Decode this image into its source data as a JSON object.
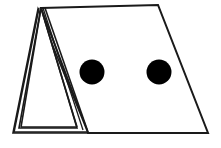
{
  "figure": {
    "background_color": "#ffffff",
    "stroke_color": "#1a1a1a",
    "dot_color": "#000000",
    "canvas": {
      "width": 221,
      "height": 148
    },
    "stroke_widths": {
      "panel_outline": 2.0,
      "fold_line": 1.6,
      "thin_fold_line": 1.3
    },
    "shapes": {
      "main_panel": {
        "name": "large-right-panel",
        "points": "41,8 158,5 208,133 88,133",
        "fill": "#ffffff"
      },
      "tent_triangle": {
        "name": "left-tent-triangle",
        "points": "41,8 77,128 19,128",
        "fill": "#ffffff"
      },
      "tent_outer_triangle": {
        "name": "left-tent-outer-triangle",
        "points": "38,9 88,133 13,133",
        "fill": "#ffffff"
      },
      "fold_lines": [
        {
          "name": "fold-left-inner",
          "d": "M 41,8 L 21,127"
        },
        {
          "name": "fold-left-outer",
          "d": "M 39,8 L 14,132"
        },
        {
          "name": "fold-base-inner",
          "d": "M 21,127 L 77,127"
        },
        {
          "name": "fold-base-outer",
          "d": "M 14,132 L 88,132"
        },
        {
          "name": "fold-right-a",
          "d": "M 41,8 L 77,127"
        },
        {
          "name": "fold-right-b",
          "d": "M 43,8 L 83,130"
        },
        {
          "name": "fold-right-c",
          "d": "M 45,8 L 88,132"
        },
        {
          "name": "spine-ridge",
          "d": "M 41,8 L 44,8"
        }
      ]
    },
    "dots": [
      {
        "name": "dot-left",
        "cx": 92,
        "cy": 72,
        "r": 12.5,
        "color": "#000000"
      },
      {
        "name": "dot-right",
        "cx": 159,
        "cy": 72,
        "r": 12.5,
        "color": "#000000"
      }
    ]
  }
}
